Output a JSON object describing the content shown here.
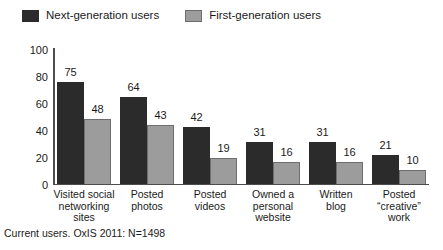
{
  "legend": {
    "entries": [
      {
        "label": "Next-generation users",
        "key": "next-gen",
        "color": "#2b2b2b"
      },
      {
        "label": "First-generation users",
        "key": "first-gen",
        "color": "#9c9c9c"
      }
    ]
  },
  "footnote": "Current users. OxIS 2011: N=1498",
  "chart_data": {
    "type": "bar",
    "title": "",
    "xlabel": "",
    "ylabel": "% of the population who have ever",
    "ylim": [
      0,
      100
    ],
    "yticks": [
      0,
      20,
      40,
      60,
      80,
      100
    ],
    "grid": false,
    "legend_position": "top-left",
    "categories": [
      "Visited social\nnetworking\nsites",
      "Posted\nphotos",
      "Posted\nvideos",
      "Owned a\npersonal\nwebsite",
      "Written\nblog",
      "Posted\n“creative”\nwork"
    ],
    "series": [
      {
        "name": "Next-generation users",
        "color": "#2b2b2b",
        "values": [
          75,
          64,
          42,
          31,
          31,
          21
        ]
      },
      {
        "name": "First-generation users",
        "color": "#9c9c9c",
        "values": [
          48,
          43,
          19,
          16,
          16,
          10
        ]
      }
    ]
  }
}
